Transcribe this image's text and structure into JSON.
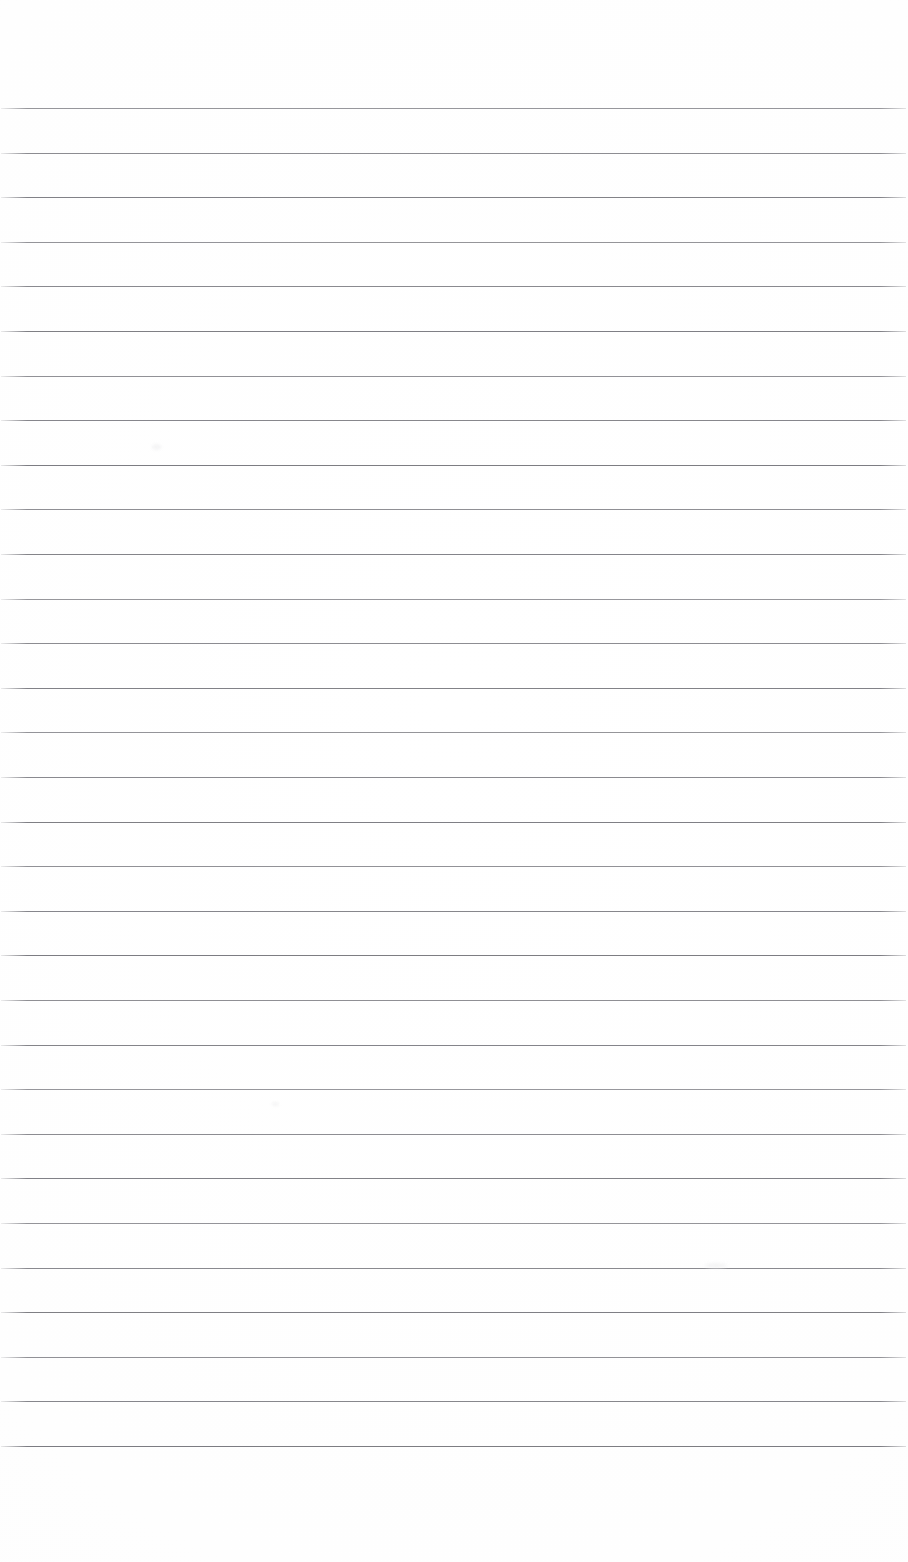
{
  "page": {
    "kind": "lined-notebook-page",
    "width_px": 908,
    "height_px": 1562,
    "background_color": "#fefefe",
    "paper_tone": "#fdfdfd",
    "has_text_content": false,
    "has_header": false,
    "has_footer": false,
    "has_page_number": false,
    "has_margin_rule": false,
    "orientation": "portrait"
  },
  "ruling": {
    "description": "Evenly spaced horizontal ruled lines spanning the full page width",
    "line_color": "#7a7a80",
    "line_thickness_px": 1,
    "line_count": 31,
    "line_spacing_px": 44.6,
    "first_line_y_px": 108,
    "last_line_y_px": 1466,
    "line_start_x_px": 1,
    "line_end_x_px": 906,
    "top_margin_px": 108,
    "bottom_margin_px": 96,
    "line_y_positions": [
      108,
      152.6,
      197.2,
      241.8,
      286.4,
      331,
      375.6,
      420.2,
      464.8,
      509.4,
      554,
      598.6,
      643.2,
      687.8,
      732.4,
      777,
      821.6,
      866.2,
      910.8,
      955.4,
      1000,
      1044.6,
      1089.2,
      1133.8,
      1178.4,
      1223,
      1267.6,
      1312.2,
      1356.8,
      1401.4,
      1446
    ]
  },
  "artifacts": {
    "description": "Faint scanner smudges on an otherwise empty page",
    "color": "#f3f3f4",
    "marks": [
      {
        "name": "smudge-upper-left",
        "x_px": 152,
        "y_px": 444,
        "w_px": 9,
        "h_px": 6
      },
      {
        "name": "smudge-lower-right",
        "x_px": 705,
        "y_px": 1263,
        "w_px": 22,
        "h_px": 5
      },
      {
        "name": "smudge-mid-center",
        "x_px": 272,
        "y_px": 1102,
        "w_px": 7,
        "h_px": 4
      }
    ]
  },
  "content": {
    "written_text": "",
    "note": "The page is blank — no handwriting, typing, headings, or page numbers are present."
  }
}
